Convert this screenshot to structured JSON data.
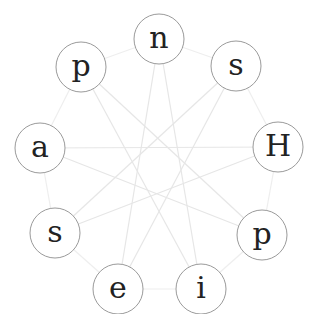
{
  "diagram": {
    "type": "circular-graph",
    "width": 322,
    "height": 314,
    "colors": {
      "background": "#ffffff",
      "node_stroke": "#9a9a9a",
      "node_fill": "#ffffff",
      "label": "#222222",
      "edge": "#e6e6e6",
      "ring_edge": "#eeeeee"
    },
    "node_radius": 25,
    "nodes": [
      {
        "id": 0,
        "label": "n",
        "x": 159,
        "y": 39
      },
      {
        "id": 1,
        "label": "s",
        "x": 236,
        "y": 66
      },
      {
        "id": 2,
        "label": "H",
        "x": 278,
        "y": 147
      },
      {
        "id": 3,
        "label": "p",
        "x": 262,
        "y": 235
      },
      {
        "id": 4,
        "label": "i",
        "x": 201,
        "y": 289
      },
      {
        "id": 5,
        "label": "e",
        "x": 118,
        "y": 289
      },
      {
        "id": 6,
        "label": "s",
        "x": 55,
        "y": 233
      },
      {
        "id": 7,
        "label": "a",
        "x": 40,
        "y": 148
      },
      {
        "id": 8,
        "label": "p",
        "x": 81,
        "y": 67
      }
    ],
    "ring_edges": [
      [
        0,
        1
      ],
      [
        1,
        2
      ],
      [
        2,
        3
      ],
      [
        3,
        4
      ],
      [
        4,
        5
      ],
      [
        5,
        6
      ],
      [
        6,
        7
      ],
      [
        7,
        8
      ],
      [
        8,
        0
      ]
    ],
    "star_edges": [
      [
        0,
        4
      ],
      [
        4,
        8
      ],
      [
        8,
        3
      ],
      [
        3,
        7
      ],
      [
        7,
        2
      ],
      [
        2,
        6
      ],
      [
        6,
        1
      ],
      [
        1,
        5
      ],
      [
        5,
        0
      ]
    ]
  }
}
